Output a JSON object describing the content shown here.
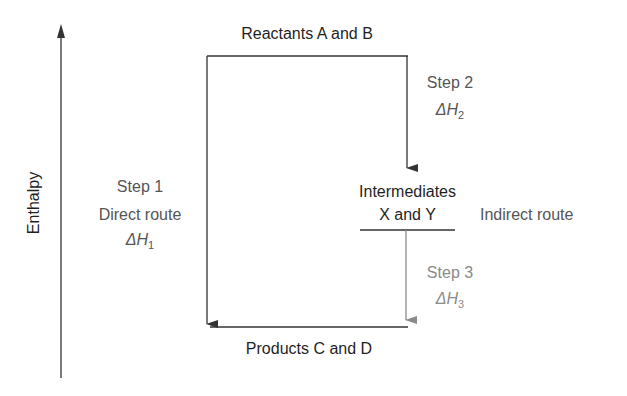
{
  "diagram": {
    "type": "enthalpy-cycle",
    "axis": {
      "label": "Enthalpy"
    },
    "levels": {
      "reactants": "Reactants A and B",
      "intermediates_line1": "Intermediates",
      "intermediates_line2": "X and Y",
      "products": "Products C and D"
    },
    "routes": {
      "direct": {
        "step": "Step 1",
        "name": "Direct route",
        "delta": "ΔH",
        "sub": "1"
      },
      "indirect": {
        "name": "Indirect route",
        "step2": {
          "step": "Step 2",
          "delta": "ΔH",
          "sub": "2"
        },
        "step3": {
          "step": "Step 3",
          "delta": "ΔH",
          "sub": "3"
        }
      }
    },
    "colors": {
      "dark": "#1f1f1f",
      "mid": "#555555",
      "light": "#8a8a8a"
    }
  }
}
